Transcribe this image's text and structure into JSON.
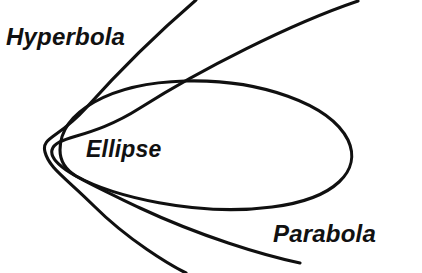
{
  "figure": {
    "width": 422,
    "height": 273,
    "background_color": "#ffffff",
    "stroke_color": "#101010",
    "stroke_width": 3.1
  },
  "labels": {
    "hyperbola": "Hyperbola",
    "ellipse": "Ellipse",
    "parabola": "Parabola"
  },
  "top_caption": {
    "visible_fragment": "",
    "note": "clipped at top edge, illegible"
  },
  "chart_data": {
    "type": "line",
    "xlabel": "",
    "ylabel": "",
    "grid": false,
    "legend": "inline annotations",
    "xlim": [
      0,
      422
    ],
    "ylim": [
      273,
      0
    ],
    "annotations": [
      {
        "text": "Hyperbola",
        "x": 6,
        "y": 45
      },
      {
        "text": "Ellipse",
        "x": 86,
        "y": 158
      },
      {
        "text": "Parabola",
        "x": 273,
        "y": 242
      }
    ],
    "series": [
      {
        "name": "Ellipse",
        "closed": true,
        "vertex": [
          60,
          150
        ],
        "path": "M 60 150 C 60 112 110 83 185 81 C 260 79 330 104 348 140 C 362 170 336 199 272 207 C 196 217 112 196 76 176 C 63 168 60 159 60 150 Z"
      },
      {
        "name": "Parabola",
        "closed": false,
        "vertex": [
          52,
          150
        ],
        "path": "M 358 1 C 290 24 200 70 140 108 C 90 140 56 135 52 150 C 48 166 88 183 140 208 C 200 236 262 255 300 263"
      },
      {
        "name": "Hyperbola",
        "closed": false,
        "vertex": [
          45,
          150
        ],
        "path": "M 196 0 C 160 31 120 70 86 108 C 58 139 41 137 45 152 C 49 168 66 178 94 206 C 128 240 170 265 186 273"
      }
    ]
  }
}
